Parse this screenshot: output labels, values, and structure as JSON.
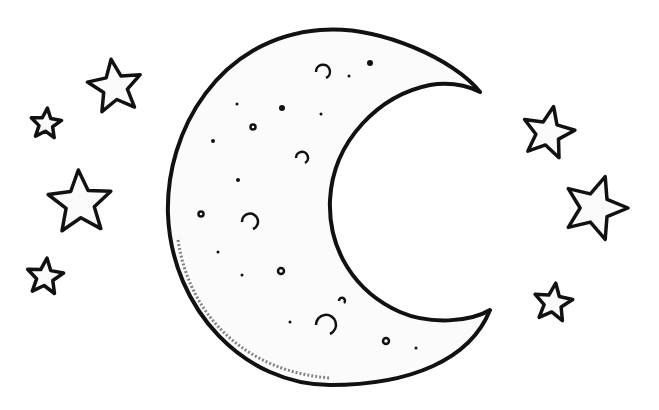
{
  "colors": {
    "background": "#ffffff",
    "ink": "#111111",
    "fill": "#fafafa"
  },
  "moon": {
    "type": "crescent",
    "craters": 8,
    "dots": 12
  },
  "stars": [
    {
      "id": "star-left-1",
      "cx": 115,
      "cy": 87,
      "r": 28,
      "rot": -8
    },
    {
      "id": "star-left-2",
      "cx": 46,
      "cy": 124,
      "r": 16,
      "rot": 5
    },
    {
      "id": "star-left-3",
      "cx": 80,
      "cy": 203,
      "r": 33,
      "rot": -3
    },
    {
      "id": "star-left-4",
      "cx": 45,
      "cy": 277,
      "r": 19,
      "rot": 6
    },
    {
      "id": "star-right-1",
      "cx": 548,
      "cy": 133,
      "r": 27,
      "rot": 12
    },
    {
      "id": "star-right-2",
      "cx": 595,
      "cy": 208,
      "r": 33,
      "rot": 18
    },
    {
      "id": "star-right-3",
      "cx": 553,
      "cy": 303,
      "r": 20,
      "rot": 8
    }
  ]
}
